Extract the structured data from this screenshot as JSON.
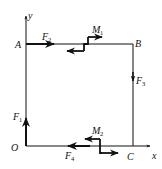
{
  "diagram": {
    "type": "force-system-on-rectangle",
    "axes": {
      "x_label": "x",
      "y_label": "y",
      "origin_label": "O"
    },
    "points": {
      "O": "O",
      "A": "A",
      "B": "B",
      "C": "C"
    },
    "forces": [
      {
        "name": "F",
        "sub": "1",
        "location": "O",
        "direction": "up (+y)"
      },
      {
        "name": "F",
        "sub": "2",
        "location": "A",
        "direction": "right (+x)"
      },
      {
        "name": "F",
        "sub": "3",
        "location": "BC midpoint",
        "direction": "down (-y)"
      },
      {
        "name": "F",
        "sub": "4",
        "location": "OC",
        "direction": "left (-x)"
      }
    ],
    "couples": [
      {
        "name": "M",
        "sub": "1",
        "location": "AB"
      },
      {
        "name": "M",
        "sub": "2",
        "location": "OC"
      }
    ],
    "colors": {
      "line": "#111111",
      "background": "#ffffff"
    }
  }
}
